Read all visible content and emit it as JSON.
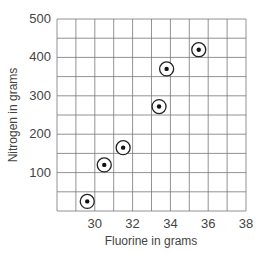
{
  "chart_data": {
    "type": "scatter",
    "title": "",
    "xlabel": "Fluorine in grams",
    "ylabel": "Nitrogen in grams",
    "xlim": [
      28,
      38
    ],
    "ylim": [
      0,
      500
    ],
    "x_ticks": [
      "30",
      "32",
      "34",
      "36",
      "38"
    ],
    "y_ticks": [
      "100",
      "200",
      "300",
      "400",
      "500"
    ],
    "grid": true,
    "grid_x_step": 1,
    "grid_y_step": 50,
    "legend": null,
    "series": [
      {
        "name": "data",
        "marker": "circled-dot",
        "points": [
          {
            "x": 29.6,
            "y": 25
          },
          {
            "x": 30.5,
            "y": 120
          },
          {
            "x": 31.5,
            "y": 165
          },
          {
            "x": 33.4,
            "y": 272
          },
          {
            "x": 33.8,
            "y": 370
          },
          {
            "x": 35.5,
            "y": 420
          }
        ]
      }
    ]
  }
}
